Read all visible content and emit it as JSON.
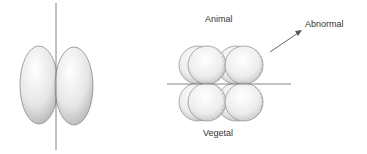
{
  "figure": {
    "left_panel": {
      "description": "Two-cell embryo with vertical cleavage plane"
    },
    "right_panel": {
      "labels": {
        "top": "Animal",
        "bottom": "Vegetal",
        "arrow": "Abnormal"
      }
    }
  },
  "colors": {
    "stroke": "#7a7a7a",
    "shade_light": "#ffffff",
    "shade_dark": "#9a9a9a",
    "text": "#333333"
  }
}
